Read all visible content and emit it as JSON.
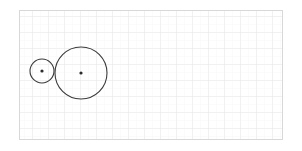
{
  "figure": {
    "background_color": "#ffffff",
    "canvas": {
      "width": 302,
      "height": 151
    }
  },
  "grid": {
    "visible": true,
    "minor_spacing": 8,
    "major_spacing": 16,
    "minor_color": "#f2f2f2",
    "major_color": "#e4e4e4",
    "minor_width": 0.6,
    "major_width": 0.8
  },
  "frame": {
    "visible": true,
    "x": 19,
    "y": 10,
    "width": 264,
    "height": 130,
    "stroke_color": "#d8d8d8",
    "stroke_width": 1,
    "fill": "none"
  },
  "shapes": [
    {
      "name": "small-circle",
      "type": "circle",
      "cx": 42,
      "cy": 71,
      "r": 12,
      "stroke_color": "#3a3a3a",
      "stroke_width": 1.1,
      "fill": "none"
    },
    {
      "name": "large-circle",
      "type": "circle",
      "cx": 81,
      "cy": 73,
      "r": 26,
      "stroke_color": "#3a3a3a",
      "stroke_width": 1.1,
      "fill": "none"
    }
  ],
  "center_markers": [
    {
      "name": "small-circle-center-dot",
      "cx": 42,
      "cy": 71,
      "r": 1.6,
      "color": "#2b2b2b"
    },
    {
      "name": "large-circle-center-dot",
      "cx": 81,
      "cy": 73,
      "r": 1.6,
      "color": "#2b2b2b"
    }
  ],
  "tangency": {
    "visible_marker": false,
    "x": 54,
    "y": 72,
    "relationship": "externally tangent"
  },
  "labels": []
}
